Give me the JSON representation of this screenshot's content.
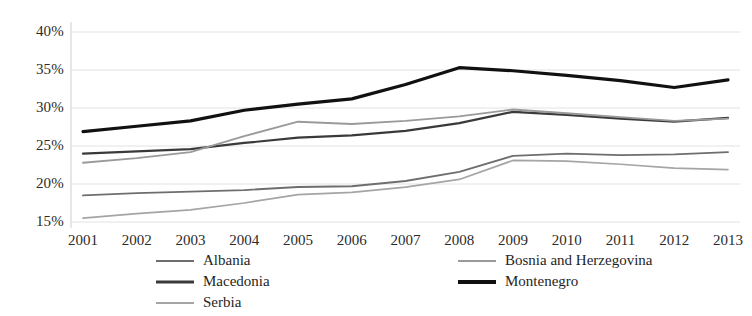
{
  "chart_data": {
    "type": "line",
    "title": "",
    "subtitle": "",
    "xlabel": "",
    "ylabel": "",
    "categories": [
      "2001",
      "2002",
      "2003",
      "2004",
      "2005",
      "2006",
      "2007",
      "2008",
      "2009",
      "2010",
      "2011",
      "2012",
      "2013"
    ],
    "x": [
      2001,
      2002,
      2003,
      2004,
      2005,
      2006,
      2007,
      2008,
      2009,
      2010,
      2011,
      2012,
      2013
    ],
    "ylim": [
      15,
      40
    ],
    "yticks": [
      15,
      20,
      25,
      30,
      35,
      40
    ],
    "ytick_labels": [
      "15%",
      "20%",
      "25%",
      "30%",
      "35%",
      "40%"
    ],
    "grid": true,
    "grid_axis": "y",
    "legend_position": "bottom",
    "legend_columns": 2,
    "series": [
      {
        "name": "Albania",
        "color": "#6e6e6e",
        "width": 1.9,
        "values": [
          18.5,
          18.8,
          19.0,
          19.2,
          19.6,
          19.7,
          20.4,
          21.6,
          23.7,
          24.0,
          23.8,
          23.9,
          24.2
        ]
      },
      {
        "name": "Macedonia",
        "color": "#3a3a3a",
        "width": 2.2,
        "values": [
          24.0,
          24.3,
          24.6,
          25.4,
          26.1,
          26.4,
          27.0,
          28.0,
          29.5,
          29.1,
          28.6,
          28.2,
          28.7
        ]
      },
      {
        "name": "Serbia",
        "color": "#a5a5a5",
        "width": 1.7,
        "values": [
          15.5,
          16.1,
          16.6,
          17.5,
          18.6,
          18.9,
          19.6,
          20.6,
          23.1,
          23.0,
          22.6,
          22.1,
          21.9
        ]
      },
      {
        "name": "Bosnia and Herzegovina",
        "color": "#9a9a9a",
        "width": 1.9,
        "values": [
          22.8,
          23.4,
          24.2,
          26.3,
          28.2,
          27.9,
          28.3,
          28.9,
          29.8,
          29.3,
          28.8,
          28.3,
          28.6
        ]
      },
      {
        "name": "Montenegro",
        "color": "#111111",
        "width": 3.2,
        "values": [
          26.9,
          27.6,
          28.3,
          29.7,
          30.5,
          31.2,
          33.1,
          35.3,
          34.9,
          34.3,
          33.6,
          32.7,
          33.7
        ]
      }
    ]
  },
  "axis": {
    "y_tick_labels": [
      "40%",
      "35%",
      "30%",
      "25%",
      "20%",
      "15%"
    ],
    "x_tick_labels": [
      "2001",
      "2002",
      "2003",
      "2004",
      "2005",
      "2006",
      "2007",
      "2008",
      "2009",
      "2010",
      "2011",
      "2012",
      "2013"
    ]
  },
  "legend": {
    "left_column": [
      {
        "label": "Albania",
        "color": "#6e6e6e",
        "width": 2
      },
      {
        "label": "Macedonia",
        "color": "#3a3a3a",
        "width": 3
      },
      {
        "label": "Serbia",
        "color": "#a5a5a5",
        "width": 2
      }
    ],
    "right_column": [
      {
        "label": "Bosnia and Herzegovina",
        "color": "#9a9a9a",
        "width": 2
      },
      {
        "label": "Montenegro",
        "color": "#111111",
        "width": 4
      }
    ]
  },
  "colors": {
    "background": "#ffffff",
    "grid": "#e2e2e2",
    "axis": "#cfcfcf",
    "text": "#2b2b2b"
  }
}
